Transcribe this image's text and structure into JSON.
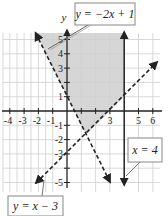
{
  "graph": {
    "type": "linear-inequality-system",
    "axes": {
      "x_label": "",
      "y_label": "y",
      "x_range": [
        -4.5,
        6.5
      ],
      "y_range": [
        -5.6,
        5.5
      ],
      "x_tick_labels": [
        "-4",
        "-3",
        "-2",
        "-1",
        "3",
        "5",
        "6"
      ],
      "x_tick_values": [
        -4,
        -3,
        -2,
        -1,
        3,
        5,
        6
      ],
      "y_tick_labels": [
        "5",
        "4",
        "3",
        "1",
        "-1",
        "-2",
        "-3",
        "-5"
      ],
      "y_tick_values": [
        5,
        4,
        3,
        1,
        -1,
        -2,
        -3,
        -5
      ],
      "grid": true
    },
    "lines": [
      {
        "id": "line1",
        "label": "y = −2x + 1",
        "style": "dashed",
        "slope": -2,
        "intercept": 1
      },
      {
        "id": "line2",
        "label": "y = x − 3",
        "style": "dashed",
        "slope": 1,
        "intercept": -3
      },
      {
        "id": "line3",
        "label": "x = 4",
        "style": "solid",
        "vertical_x": 4
      }
    ],
    "shaded_region": {
      "description": "y > −2x + 1, y > x − 3, x < 4",
      "color": "#d6d6d6"
    },
    "colors": {
      "grid": "#d4d4d4",
      "axis": "#222222",
      "line": "#222222",
      "label_border": "#888888"
    }
  }
}
